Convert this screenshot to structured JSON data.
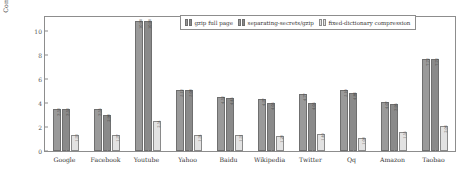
{
  "chart_data": {
    "type": "bar",
    "title": "",
    "xlabel": "",
    "ylabel": "Compression ratio",
    "ylim": [
      0,
      11.2
    ],
    "yticks": [
      0,
      2,
      4,
      6,
      8,
      10
    ],
    "grid": false,
    "legend_position": "top-right",
    "categories": [
      "Google",
      "Facebook",
      "Youtube",
      "Yahoo",
      "Baidu",
      "Wikipedia",
      "Twitter",
      "Qq",
      "Amazon",
      "Taobao"
    ],
    "series": [
      {
        "name": "gzip full page",
        "color": "#9a9a9a",
        "values": [
          3.53,
          3.55,
          10.9,
          5.12,
          4.52,
          4.37,
          4.77,
          5.1,
          4.07,
          7.72
        ],
        "labels": [
          "3.53",
          "3.55",
          "10.90",
          "5.12",
          "4.52",
          "4.37",
          "4.77",
          "5.10",
          "4.07",
          "7.72"
        ]
      },
      {
        "name": "separating-secrets/gzip",
        "color": "#8a8a8a",
        "values": [
          3.53,
          2.98,
          10.9,
          5.08,
          4.45,
          4.05,
          4.05,
          4.86,
          3.95,
          7.72
        ],
        "labels": [
          "3.53",
          "2.98",
          "10.90",
          "5.08",
          "4.45",
          "4.05",
          "4.05",
          "4.86",
          "3.95",
          "7.72"
        ]
      },
      {
        "name": "fixed-dictionary compression",
        "color": "#e2e2e2",
        "values": [
          1.33,
          1.37,
          2.54,
          1.34,
          1.31,
          1.28,
          1.4,
          1.08,
          1.55,
          2.06
        ],
        "labels": [
          "1.33",
          "1.37",
          "2.54",
          "1.34",
          "1.31",
          "1.28",
          "1.40",
          "1.08",
          "1.55",
          "2.06"
        ]
      }
    ]
  }
}
